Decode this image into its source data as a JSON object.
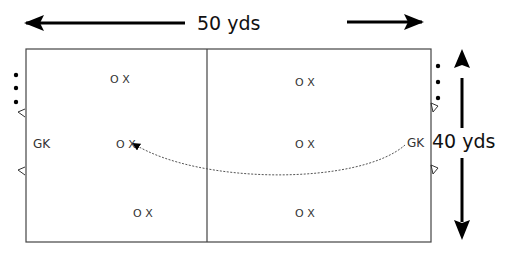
{
  "diagram": {
    "type": "soccer-drill-field",
    "width_label": "50 yds",
    "height_label": "40 yds",
    "field": {
      "left": 26,
      "top": 49,
      "right": 431,
      "bottom": 242,
      "midline_x": 207
    },
    "goalkeepers": [
      {
        "label": "GK",
        "side": "left",
        "x": 33,
        "y": 144
      },
      {
        "label": "GK",
        "side": "right",
        "x": 407,
        "y": 143
      }
    ],
    "players": [
      {
        "label": "O X",
        "x": 110,
        "y": 82
      },
      {
        "label": "O X",
        "x": 116,
        "y": 147
      },
      {
        "label": "O X",
        "x": 133,
        "y": 217
      },
      {
        "label": "O X",
        "x": 296,
        "y": 85
      },
      {
        "label": "O X",
        "x": 296,
        "y": 147
      },
      {
        "label": "O X",
        "x": 296,
        "y": 216
      }
    ],
    "ball_dots": {
      "left": [
        {
          "x": 16,
          "y": 75
        },
        {
          "x": 16,
          "y": 88
        },
        {
          "x": 16,
          "y": 102
        }
      ],
      "right": [
        {
          "x": 438,
          "y": 66
        },
        {
          "x": 438,
          "y": 82
        },
        {
          "x": 438,
          "y": 98
        }
      ]
    },
    "cones": {
      "left": [
        {
          "x": 22,
          "y": 112
        },
        {
          "x": 22,
          "y": 170
        }
      ],
      "right": [
        {
          "x": 434,
          "y": 107
        },
        {
          "x": 434,
          "y": 169
        }
      ]
    },
    "pass_path": {
      "from": "right GK",
      "to": "center-left O X",
      "style": "dotted arc with arrowhead"
    },
    "colors": {
      "line": "#444444",
      "arrow": "#000000",
      "text": "#111111"
    }
  }
}
